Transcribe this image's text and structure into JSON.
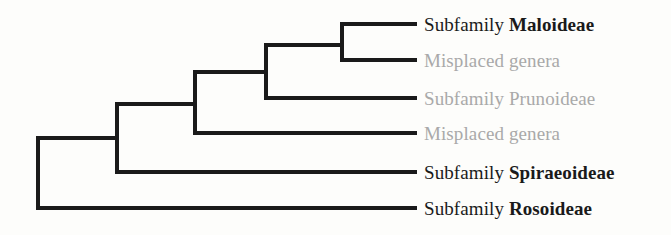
{
  "figure": {
    "name": "rosaceae-cladogram",
    "type": "cladogram",
    "background_color": "#fdfdfb",
    "branch_color": "#1a1a1a",
    "branch_width": 4,
    "dark_text_color": "#1a1a1a",
    "muted_text_color": "#a9a9a9"
  },
  "tips": [
    {
      "id": "maloideae",
      "rank_prefix": "Subfamily ",
      "taxon": "Maloideae",
      "full_text": "Subfamily Maloideae",
      "style": "dark",
      "emphasis": "bold",
      "y": 24
    },
    {
      "id": "misplaced-genera-upper",
      "rank_prefix": "",
      "taxon": "Misplaced genera",
      "full_text": "Misplaced genera",
      "style": "muted",
      "emphasis": "regular",
      "y": 60
    },
    {
      "id": "prunoideae",
      "rank_prefix": "Subfamily ",
      "taxon": "Prunoideae",
      "full_text": "Subfamily Prunoideae",
      "style": "muted",
      "emphasis": "regular",
      "y": 98
    },
    {
      "id": "misplaced-genera-lower",
      "rank_prefix": "",
      "taxon": "Misplaced genera",
      "full_text": "Misplaced genera",
      "style": "muted",
      "emphasis": "regular",
      "y": 133
    },
    {
      "id": "spiraeoideae",
      "rank_prefix": "Subfamily ",
      "taxon": "Spiraeoideae",
      "full_text": "Subfamily Spiraeoideae",
      "style": "dark",
      "emphasis": "bold",
      "y": 172
    },
    {
      "id": "rosoideae",
      "rank_prefix": "Subfamily ",
      "taxon": "Rosoideae",
      "full_text": "Subfamily Rosoideae",
      "style": "dark",
      "emphasis": "bold",
      "y": 208
    }
  ],
  "chart_data": {
    "type": "tree",
    "title": "",
    "layout": "rectangular-ladder-right",
    "tip_line_end_x": 417,
    "nodes": [
      {
        "id": "root",
        "x": 38,
        "child_top_y": 138,
        "child_bottom_y": 208
      },
      {
        "id": "node2",
        "x": 117,
        "child_top_y": 104,
        "child_bottom_y": 172
      },
      {
        "id": "node3",
        "x": 195,
        "child_top_y": 72,
        "child_bottom_y": 133
      },
      {
        "id": "node4",
        "x": 266,
        "child_top_y": 45,
        "child_bottom_y": 98
      },
      {
        "id": "node5",
        "x": 342,
        "child_top_y": 24,
        "child_bottom_y": 60
      }
    ],
    "edges": [
      {
        "from": "root",
        "to": "node2",
        "y": 138
      },
      {
        "from": "root",
        "to": "rosoideae",
        "y": 208
      },
      {
        "from": "node2",
        "to": "node3",
        "y": 104
      },
      {
        "from": "node2",
        "to": "spiraeoideae",
        "y": 172
      },
      {
        "from": "node3",
        "to": "node4",
        "y": 72
      },
      {
        "from": "node3",
        "to": "misplaced-genera-lower",
        "y": 133
      },
      {
        "from": "node4",
        "to": "node5",
        "y": 45
      },
      {
        "from": "node4",
        "to": "prunoideae",
        "y": 98
      },
      {
        "from": "node5",
        "to": "maloideae",
        "y": 24
      },
      {
        "from": "node5",
        "to": "misplaced-genera-upper",
        "y": 60
      }
    ]
  }
}
